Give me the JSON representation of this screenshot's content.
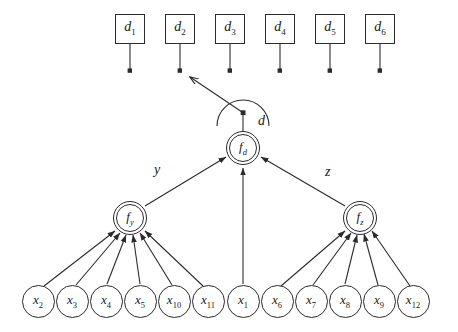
{
  "diagram": {
    "stroke_color": "#2b2b2b",
    "background_color": "#ffffff",
    "top_boxes": [
      {
        "name": "d1",
        "base": "d",
        "sub": "1",
        "x": 115,
        "y": 14
      },
      {
        "name": "d2",
        "base": "d",
        "sub": "2",
        "x": 165,
        "y": 14
      },
      {
        "name": "d3",
        "base": "d",
        "sub": "3",
        "x": 215,
        "y": 14
      },
      {
        "name": "d4",
        "base": "d",
        "sub": "4",
        "x": 265,
        "y": 14
      },
      {
        "name": "d5",
        "base": "d",
        "sub": "5",
        "x": 315,
        "y": 14
      },
      {
        "name": "d6",
        "base": "d",
        "sub": "6",
        "x": 365,
        "y": 14
      }
    ],
    "function_nodes": [
      {
        "name": "f_y",
        "base": "f",
        "sub": "y",
        "cx": 130,
        "cy": 218
      },
      {
        "name": "f_d",
        "base": "f",
        "sub": "d",
        "cx": 243,
        "cy": 148
      },
      {
        "name": "f_z",
        "base": "f",
        "sub": "z",
        "cx": 360,
        "cy": 218
      }
    ],
    "variable_nodes": [
      {
        "name": "x2",
        "base": "x",
        "sub": "2",
        "cx": 38,
        "cy": 301,
        "group": "y"
      },
      {
        "name": "x3",
        "base": "x",
        "sub": "3",
        "cx": 72,
        "cy": 301,
        "group": "y"
      },
      {
        "name": "x4",
        "base": "x",
        "sub": "4",
        "cx": 106,
        "cy": 301,
        "group": "y"
      },
      {
        "name": "x5",
        "base": "x",
        "sub": "5",
        "cx": 140,
        "cy": 301,
        "group": "y"
      },
      {
        "name": "x10",
        "base": "x",
        "sub": "10",
        "cx": 174,
        "cy": 301,
        "group": "y"
      },
      {
        "name": "x11",
        "base": "x",
        "sub": "11",
        "cx": 208,
        "cy": 301,
        "group": "y"
      },
      {
        "name": "x1",
        "base": "x",
        "sub": "1",
        "cx": 243,
        "cy": 301,
        "group": "d"
      },
      {
        "name": "x6",
        "base": "x",
        "sub": "6",
        "cx": 277,
        "cy": 301,
        "group": "z"
      },
      {
        "name": "x7",
        "base": "x",
        "sub": "7",
        "cx": 311,
        "cy": 301,
        "group": "z"
      },
      {
        "name": "x8",
        "base": "x",
        "sub": "8",
        "cx": 345,
        "cy": 301,
        "group": "z"
      },
      {
        "name": "x9",
        "base": "x",
        "sub": "9",
        "cx": 379,
        "cy": 301,
        "group": "z"
      },
      {
        "name": "x12",
        "base": "x",
        "sub": "12",
        "cx": 413,
        "cy": 301,
        "group": "z"
      }
    ],
    "edge_labels": [
      {
        "name": "edge-label-y",
        "text": "y",
        "x": 154,
        "y": 163
      },
      {
        "name": "edge-label-d",
        "text": "d",
        "x": 258,
        "y": 114
      },
      {
        "name": "edge-label-z",
        "text": "z",
        "x": 325,
        "y": 165
      }
    ],
    "message_arrow": {
      "name": "outgoing-message-arrow",
      "from_x": 243,
      "from_y": 112,
      "to_x": 189,
      "to_y": 76
    },
    "arc": {
      "name": "message-arc",
      "cx": 243,
      "cy": 118,
      "r": 26
    }
  }
}
